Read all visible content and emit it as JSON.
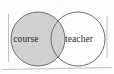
{
  "figure": {
    "type": "venn-diagram",
    "background_color": "#fdfdfd",
    "caption": "",
    "sets": [
      {
        "id": "left",
        "label": "course",
        "fill_color": "#d0d0d0",
        "stroke_color": "#6e6e6e",
        "shaded": true,
        "center_x": 38,
        "center_y": 39,
        "radius": 27,
        "label_x": 26,
        "label_y": 42
      },
      {
        "id": "right",
        "label": "teacher",
        "fill_color": "#ffffff",
        "stroke_color": "#6e6e6e",
        "shaded": false,
        "center_x": 78,
        "center_y": 39,
        "radius": 27,
        "label_x": 79,
        "label_y": 42
      }
    ],
    "frame": {
      "left_line_x": 8.5,
      "right_line_x": 107,
      "bottom_line_y": 68,
      "stroke_color": "#b9b9b9"
    }
  }
}
